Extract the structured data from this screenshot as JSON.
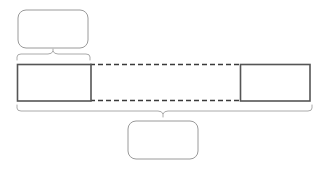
{
  "diagram": {
    "type": "annotated-bar-with-braces",
    "background_color": "#ffffff",
    "stroke_color_solid": "#555555",
    "stroke_color_dashed": "#3a3a3a",
    "stroke_color_brace": "#aaaaaa",
    "stroke_color_callout": "#9a9a9a",
    "callout_fill": "#ffffff",
    "segment_fill": "#ffffff"
  },
  "callouts": [
    {
      "id": "top-callout",
      "label": "",
      "x": 18,
      "y": 10,
      "width": 70,
      "height": 38,
      "corner_radius": 8
    },
    {
      "id": "bottom-callout",
      "label": "",
      "x": 128,
      "y": 121,
      "width": 70,
      "height": 38,
      "corner_radius": 8
    }
  ],
  "segments": [
    {
      "id": "left-segment",
      "label": "",
      "x": 17,
      "y": 64,
      "width": 74,
      "height": 37
    },
    {
      "id": "right-segment",
      "label": "",
      "x": 240,
      "y": 64,
      "width": 70,
      "height": 37
    }
  ],
  "connectors": [
    {
      "id": "top-dashed-connector",
      "x1": 91,
      "y1": 64,
      "x2": 240,
      "y2": 64,
      "dash": "5 3"
    },
    {
      "id": "bottom-dashed-connector",
      "x1": 91,
      "y1": 101,
      "x2": 240,
      "y2": 101,
      "dash": "5 3"
    }
  ],
  "braces": [
    {
      "id": "top-brace",
      "orientation": "up",
      "left": 17,
      "right": 90,
      "center": 53,
      "baseline": 60,
      "tip": 51
    },
    {
      "id": "bottom-brace",
      "orientation": "down",
      "left": 17,
      "right": 312,
      "center": 163,
      "baseline": 106,
      "tip": 116
    }
  ]
}
